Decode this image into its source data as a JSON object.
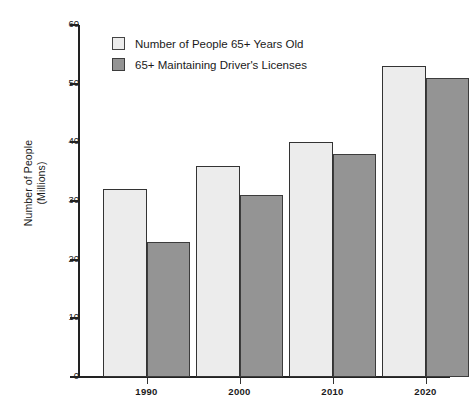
{
  "chart_data": {
    "type": "bar",
    "title": "",
    "subtitle": "",
    "xlabel": "",
    "ylabel": "Number of People (Millions)",
    "ylabel_lines": [
      "Number of People",
      "(Millions)"
    ],
    "categories": [
      "1990",
      "2000",
      "2010",
      "2020"
    ],
    "series": [
      {
        "name": "Number of People 65+ Years Old",
        "color": "#ececec",
        "values": [
          32,
          36,
          40,
          53
        ]
      },
      {
        "name": "65+ Maintaining Driver's Licenses",
        "color": "#949494",
        "values": [
          23,
          31,
          38,
          51
        ]
      }
    ],
    "ylim": [
      0,
      60
    ],
    "yticks": [
      0,
      10,
      20,
      30,
      40,
      50,
      60
    ],
    "ytick_labels": [
      "0",
      "10",
      "20",
      "30",
      "40",
      "50",
      "60"
    ],
    "grid": false,
    "legend_position": "top-left",
    "bar_border_color": "#333333",
    "axis_color": "#222222",
    "background": "#ffffff"
  },
  "legend": {
    "items": [
      {
        "label": "Number of People 65+ Years Old",
        "swatch": "light"
      },
      {
        "label": "65+ Maintaining Driver's Licenses",
        "swatch": "dark"
      }
    ]
  }
}
